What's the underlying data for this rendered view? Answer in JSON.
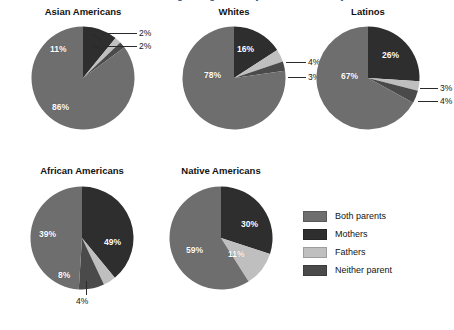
{
  "figure": {
    "banner_title": "Children's Living Arrangements by Race and Ethnicity",
    "background_color": "#ffffff"
  },
  "legend": {
    "position": "bottom-right",
    "items": [
      {
        "label": "Both parents",
        "color": "#6e6e6e"
      },
      {
        "label": "Mothers",
        "color": "#2e2e2e"
      },
      {
        "label": "Fathers",
        "color": "#bfbfbf"
      },
      {
        "label": "Neither parent",
        "color": "#4a4a4a"
      }
    ]
  },
  "chart_data": {
    "type": "pie",
    "title": "Children's Living Arrangements by Race and Ethnicity",
    "xlabel": "",
    "ylabel": "",
    "units": "percent",
    "legend_position": "bottom-right",
    "grid": false,
    "categories": [
      "Both parents",
      "Mothers",
      "Fathers",
      "Neither parent"
    ],
    "colors": [
      "#6e6e6e",
      "#2e2e2e",
      "#bfbfbf",
      "#4a4a4a"
    ],
    "panels": [
      {
        "name": "Asian Americans",
        "values": [
          86,
          11,
          2,
          2
        ],
        "labels": [
          "86%",
          "11%",
          "2%",
          "2%"
        ],
        "label_placement": [
          "inside",
          "inside",
          "callout",
          "callout"
        ]
      },
      {
        "name": "Whites",
        "values": [
          78,
          16,
          4,
          3
        ],
        "labels": [
          "78%",
          "16%",
          "4%",
          "3%"
        ],
        "label_placement": [
          "inside",
          "inside",
          "callout",
          "callout"
        ]
      },
      {
        "name": "Latinos",
        "values": [
          67,
          26,
          3,
          4
        ],
        "labels": [
          "67%",
          "26%",
          "3%",
          "4%"
        ],
        "label_placement": [
          "inside",
          "inside",
          "callout",
          "callout"
        ]
      },
      {
        "name": "African Americans",
        "values": [
          49,
          39,
          4,
          8
        ],
        "labels": [
          "49%",
          "39%",
          "4%",
          "8%"
        ],
        "label_placement": [
          "inside",
          "inside",
          "callout",
          "inside"
        ]
      },
      {
        "name": "Native Americans",
        "values": [
          59,
          30,
          11,
          0
        ],
        "labels": [
          "59%",
          "30%",
          "11%",
          ""
        ],
        "label_placement": [
          "inside",
          "inside",
          "inside",
          "none"
        ]
      }
    ]
  },
  "panels": {
    "asian": {
      "title": "Asian Americans",
      "v_both": "86%",
      "v_mothers": "11%",
      "v_fathers": "2%",
      "v_neither": "2%"
    },
    "whites": {
      "title": "Whites",
      "v_both": "78%",
      "v_mothers": "16%",
      "v_fathers": "4%",
      "v_neither": "3%"
    },
    "latinos": {
      "title": "Latinos",
      "v_both": "67%",
      "v_mothers": "26%",
      "v_fathers": "3%",
      "v_neither": "4%"
    },
    "african": {
      "title": "African Americans",
      "v_both": "49%",
      "v_mothers": "39%",
      "v_fathers": "4%",
      "v_neither": "8%"
    },
    "native": {
      "title": "Native Americans",
      "v_both": "59%",
      "v_mothers": "30%",
      "v_fathers": "11%"
    }
  }
}
